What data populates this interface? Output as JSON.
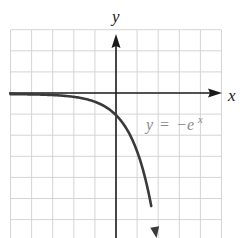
{
  "chart_data": {
    "type": "line",
    "title": "",
    "xlabel": "x",
    "ylabel": "y",
    "xlim": [
      -5,
      5
    ],
    "ylim": [
      -7,
      3
    ],
    "grid": true,
    "grid_step": 1,
    "tick_labels": false,
    "series": [
      {
        "name": "y = -e^x",
        "function": "-exp(x)",
        "x": [
          -5,
          -4,
          -3,
          -2,
          -1,
          0,
          0.5,
          1,
          1.5,
          1.92
        ],
        "values": [
          -0.007,
          -0.018,
          -0.05,
          -0.135,
          -0.368,
          -1,
          -1.65,
          -2.72,
          -4.48,
          -6.8
        ],
        "arrow_end": true
      }
    ],
    "annotations": [
      {
        "text": "y = −e^x",
        "x": 1.4,
        "y": -1.7
      }
    ]
  },
  "labels": {
    "x_axis": "x",
    "y_axis": "y",
    "equation_lhs": "y",
    "equation_op": "=",
    "equation_rhs_base": "−e",
    "equation_rhs_exp": "x"
  },
  "colors": {
    "grid": "#d4d4d4",
    "axis": "#1a1a1a",
    "curve": "#3a3a3a",
    "equation": "#8a8a8a"
  }
}
